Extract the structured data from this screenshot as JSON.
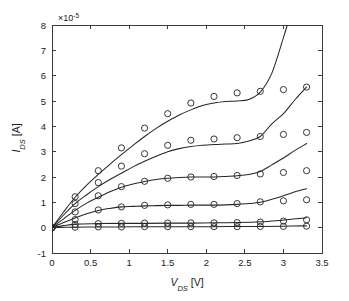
{
  "chart_data": {
    "type": "scatter",
    "title": "",
    "subtitle": "",
    "xlabel": "V_DS [V]",
    "xlabel_parts": {
      "symbol": "V",
      "subscript": "DS",
      "unit": "[V]"
    },
    "ylabel": "I_DS [A]",
    "ylabel_parts": {
      "symbol": "I",
      "subscript": "DS",
      "unit": "[A]"
    },
    "y_exponent_label": "×10",
    "y_exponent_power": "-5",
    "y_scale_factor": 1e-05,
    "xlim": [
      0,
      3.5
    ],
    "ylim": [
      -1,
      8
    ],
    "xticks": [
      0,
      0.5,
      1,
      1.5,
      2,
      2.5,
      3,
      3.5
    ],
    "xticklabels": [
      "0",
      "0.5",
      "1",
      "1.5",
      "2",
      "2.5",
      "3",
      "3.5"
    ],
    "yticks": [
      -1,
      0,
      1,
      2,
      3,
      4,
      5,
      6,
      7,
      8
    ],
    "yticklabels": [
      "-1",
      "0",
      "1",
      "2",
      "3",
      "4",
      "5",
      "6",
      "7",
      "8"
    ],
    "grid": false,
    "legend": null,
    "legend_position": "none",
    "box": true,
    "marker_style": "open-circle",
    "line_color": "#262626",
    "marker_color": "#2b2b2b",
    "background_color": "#ffffff",
    "axis_color": "#3c3c3c",
    "marker_x": [
      0,
      0.3,
      0.6,
      0.9,
      1.2,
      1.5,
      1.8,
      2.1,
      2.4,
      2.7,
      3.0,
      3.3
    ],
    "series": [
      {
        "name": "curve-1-measured",
        "role": "measured-markers",
        "values": [
          0.0,
          1.22,
          2.25,
          3.15,
          3.93,
          4.5,
          4.92,
          5.18,
          5.32,
          5.38,
          5.45,
          5.55
        ]
      },
      {
        "name": "curve-2-measured",
        "role": "measured-markers",
        "values": [
          0.0,
          0.95,
          1.78,
          2.43,
          2.92,
          3.25,
          3.45,
          3.5,
          3.55,
          3.6,
          3.68,
          3.76
        ]
      },
      {
        "name": "curve-3-measured",
        "role": "measured-markers",
        "values": [
          0.0,
          0.62,
          1.26,
          1.62,
          1.83,
          1.95,
          2.0,
          2.02,
          2.06,
          2.12,
          2.18,
          2.25
        ]
      },
      {
        "name": "curve-4-measured",
        "role": "measured-markers",
        "values": [
          0.0,
          0.32,
          0.7,
          0.82,
          0.88,
          0.9,
          0.92,
          0.92,
          0.95,
          1.02,
          1.06,
          1.1
        ]
      },
      {
        "name": "curve-5-measured",
        "role": "measured-markers",
        "values": [
          0.0,
          0.13,
          0.16,
          0.17,
          0.18,
          0.18,
          0.19,
          0.19,
          0.2,
          0.22,
          0.26,
          0.31
        ]
      },
      {
        "name": "curve-6-measured",
        "role": "measured-markers",
        "values": [
          0.0,
          0.02,
          0.03,
          0.03,
          0.04,
          0.04,
          0.04,
          0.04,
          0.04,
          0.05,
          0.05,
          0.06
        ]
      }
    ],
    "model_curves": [
      {
        "name": "curve-1-model",
        "role": "model-line",
        "x": [
          0,
          0.15,
          0.3,
          0.45,
          0.6,
          0.75,
          0.9,
          1.05,
          1.2,
          1.35,
          1.5,
          1.65,
          1.8,
          1.95,
          2.1,
          2.25,
          2.4,
          2.55,
          2.7,
          2.85,
          3.0,
          3.05
        ],
        "y": [
          0.0,
          0.62,
          1.2,
          1.68,
          2.1,
          2.5,
          2.88,
          3.25,
          3.6,
          3.92,
          4.2,
          4.45,
          4.65,
          4.82,
          4.92,
          4.98,
          5.0,
          5.06,
          5.35,
          6.1,
          7.5,
          8.0
        ]
      },
      {
        "name": "curve-2-model",
        "role": "model-line",
        "x": [
          0,
          0.15,
          0.3,
          0.45,
          0.6,
          0.75,
          0.9,
          1.05,
          1.2,
          1.35,
          1.5,
          1.65,
          1.8,
          1.95,
          2.1,
          2.25,
          2.4,
          2.55,
          2.7,
          2.85,
          3.0,
          3.15,
          3.3
        ],
        "y": [
          0.0,
          0.5,
          0.95,
          1.3,
          1.62,
          1.9,
          2.15,
          2.4,
          2.62,
          2.82,
          3.0,
          3.12,
          3.2,
          3.25,
          3.28,
          3.3,
          3.32,
          3.42,
          3.6,
          4.1,
          4.5,
          5.05,
          5.55
        ]
      },
      {
        "name": "curve-3-model",
        "role": "model-line",
        "x": [
          0,
          0.15,
          0.3,
          0.45,
          0.6,
          0.75,
          0.9,
          1.05,
          1.2,
          1.35,
          1.5,
          1.65,
          1.8,
          1.95,
          2.1,
          2.25,
          2.4,
          2.55,
          2.7,
          2.85,
          3.0,
          3.15,
          3.3
        ],
        "y": [
          0.0,
          0.35,
          0.68,
          0.97,
          1.2,
          1.42,
          1.6,
          1.72,
          1.82,
          1.9,
          1.95,
          1.98,
          2.0,
          2.0,
          2.0,
          2.02,
          2.05,
          2.1,
          2.22,
          2.48,
          2.75,
          3.05,
          3.32
        ]
      },
      {
        "name": "curve-4-model",
        "role": "model-line",
        "x": [
          0,
          0.15,
          0.3,
          0.45,
          0.6,
          0.75,
          0.9,
          1.05,
          1.2,
          1.35,
          1.5,
          1.65,
          1.8,
          1.95,
          2.1,
          2.25,
          2.4,
          2.55,
          2.7,
          2.85,
          3.0,
          3.15,
          3.3
        ],
        "y": [
          0.0,
          0.2,
          0.38,
          0.55,
          0.68,
          0.76,
          0.82,
          0.84,
          0.86,
          0.87,
          0.88,
          0.88,
          0.89,
          0.89,
          0.89,
          0.9,
          0.92,
          0.95,
          1.0,
          1.12,
          1.26,
          1.42,
          1.54
        ]
      },
      {
        "name": "curve-5-model",
        "role": "model-line",
        "x": [
          0,
          0.15,
          0.3,
          0.6,
          0.9,
          1.2,
          1.5,
          1.8,
          2.1,
          2.4,
          2.7,
          3.0,
          3.3
        ],
        "y": [
          0.0,
          0.08,
          0.14,
          0.16,
          0.17,
          0.17,
          0.18,
          0.18,
          0.19,
          0.2,
          0.23,
          0.3,
          0.39
        ]
      },
      {
        "name": "curve-6-model",
        "role": "model-line",
        "x": [
          0,
          0.3,
          0.6,
          0.9,
          1.2,
          1.5,
          1.8,
          2.1,
          2.4,
          2.7,
          3.0,
          3.3
        ],
        "y": [
          0.0,
          0.02,
          0.03,
          0.03,
          0.04,
          0.04,
          0.04,
          0.04,
          0.05,
          0.05,
          0.06,
          0.07
        ]
      }
    ]
  }
}
